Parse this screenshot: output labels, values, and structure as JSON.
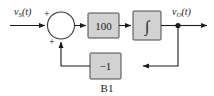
{
  "diagram": {
    "caption": "B1",
    "background_color": "#ffffff",
    "block_fill_color": "#d2d2d2",
    "block_border_color": "#4a4a4a",
    "wire_color": "#1a1a1a",
    "input_signal": {
      "base": "v",
      "subscript": "S",
      "arg": "(t)",
      "full": "vS(t)"
    },
    "output_signal": {
      "base": "v",
      "subscript": "O",
      "arg": "(t)",
      "full": "vO(t)"
    },
    "summing_junction": {
      "name": "summing-junction",
      "input_sign_top": "+",
      "input_sign_bottom": "+"
    },
    "blocks": [
      {
        "id": "gain-block",
        "label": "100",
        "kind": "gain"
      },
      {
        "id": "integrator-block",
        "label": "∫",
        "kind": "integrator"
      },
      {
        "id": "feedback-gain-block",
        "label": "−1",
        "kind": "feedback-gain"
      }
    ]
  }
}
